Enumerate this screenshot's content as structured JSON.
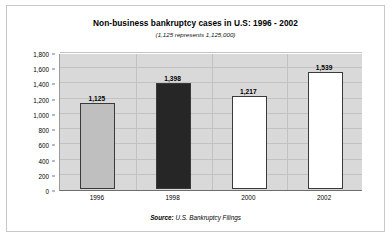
{
  "chart_data": {
    "type": "bar",
    "title": "Non-business bankruptcy cases in U.S: 1996 - 2002",
    "subtitle": "(1,125 represents 1,125,000)",
    "categories": [
      "1996",
      "1998",
      "2000",
      "2002"
    ],
    "values": [
      1125,
      1398,
      1217,
      1539
    ],
    "data_labels": [
      "1,125",
      "1,398",
      "1,217",
      "1,539"
    ],
    "bar_colors": [
      "#bfbfbf",
      "#262626",
      "#ffffff",
      "#ffffff"
    ],
    "bar_border_color": "#3a3a3a",
    "xlabel": "",
    "ylabel": "",
    "ylim": [
      0,
      1800
    ],
    "ytick_step": 200,
    "ytick_labels": [
      "0",
      "200",
      "400",
      "600",
      "800",
      "1,000",
      "1,200",
      "1,400",
      "1,600",
      "1,800"
    ],
    "ytick_values": [
      0,
      200,
      400,
      600,
      800,
      1000,
      1200,
      1400,
      1600,
      1800
    ],
    "grid": true,
    "legend": false,
    "plot_background": "#d9d9d9",
    "source_label": "Source:",
    "source_text": "U.S. Bankruptcy Filings"
  }
}
